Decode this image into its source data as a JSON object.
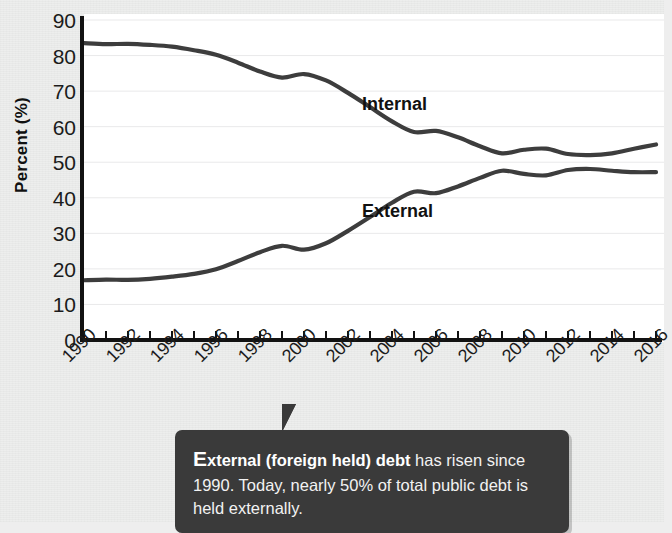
{
  "chart_data": {
    "type": "line",
    "title": "",
    "xlabel": "",
    "ylabel": "Percent (%)",
    "ylim": [
      0,
      90
    ],
    "xlim": [
      1990,
      2016
    ],
    "grid": true,
    "legend_position": "inline-series-labels",
    "ytick_labels": [
      "90",
      "80",
      "70",
      "60",
      "50",
      "40",
      "30",
      "20",
      "10",
      "0"
    ],
    "ytick_values": [
      90,
      80,
      70,
      60,
      50,
      40,
      30,
      20,
      10,
      0
    ],
    "xtick_labels": [
      "1990",
      "1992",
      "1994",
      "1996",
      "1998",
      "2000",
      "2002",
      "2004",
      "2006",
      "2008",
      "2010",
      "2012",
      "2014",
      "2016"
    ],
    "xtick_values": [
      1990,
      1992,
      1994,
      1996,
      1998,
      2000,
      2002,
      2004,
      2006,
      2008,
      2010,
      2012,
      2014,
      2016
    ],
    "minor_tick_interval": 1,
    "x": [
      1990,
      1991,
      1992,
      1993,
      1994,
      1995,
      1996,
      1997,
      1998,
      1999,
      2000,
      2001,
      2002,
      2003,
      2004,
      2005,
      2006,
      2007,
      2008,
      2009,
      2010,
      2011,
      2012,
      2013,
      2014,
      2015,
      2016
    ],
    "series": [
      {
        "name": "Internal",
        "color": "#3d3d3d",
        "label_x": 2002,
        "label_y": 66,
        "values": [
          83.5,
          83.2,
          83.3,
          83.0,
          82.5,
          81.5,
          80.2,
          78.0,
          75.5,
          73.8,
          74.8,
          73.0,
          69.5,
          65.5,
          61.5,
          58.5,
          58.8,
          57.0,
          54.5,
          52.5,
          53.5,
          53.8,
          52.3,
          52.0,
          52.5,
          53.8,
          55.0
        ]
      },
      {
        "name": "External",
        "color": "#3d3d3d",
        "label_x": 2002,
        "label_y": 36,
        "values": [
          16.8,
          17.0,
          16.9,
          17.2,
          17.8,
          18.6,
          19.9,
          22.2,
          24.7,
          26.5,
          25.4,
          27.2,
          30.7,
          34.6,
          38.6,
          41.7,
          41.3,
          43.2,
          45.6,
          47.6,
          46.7,
          46.3,
          47.8,
          48.1,
          47.6,
          47.2,
          47.2
        ]
      }
    ]
  },
  "annotation": {
    "dropcap": "E",
    "lead": "xternal (foreign held) debt",
    "body": " has risen since 1990. Today, nearly 50% of total public debt is held externally."
  }
}
